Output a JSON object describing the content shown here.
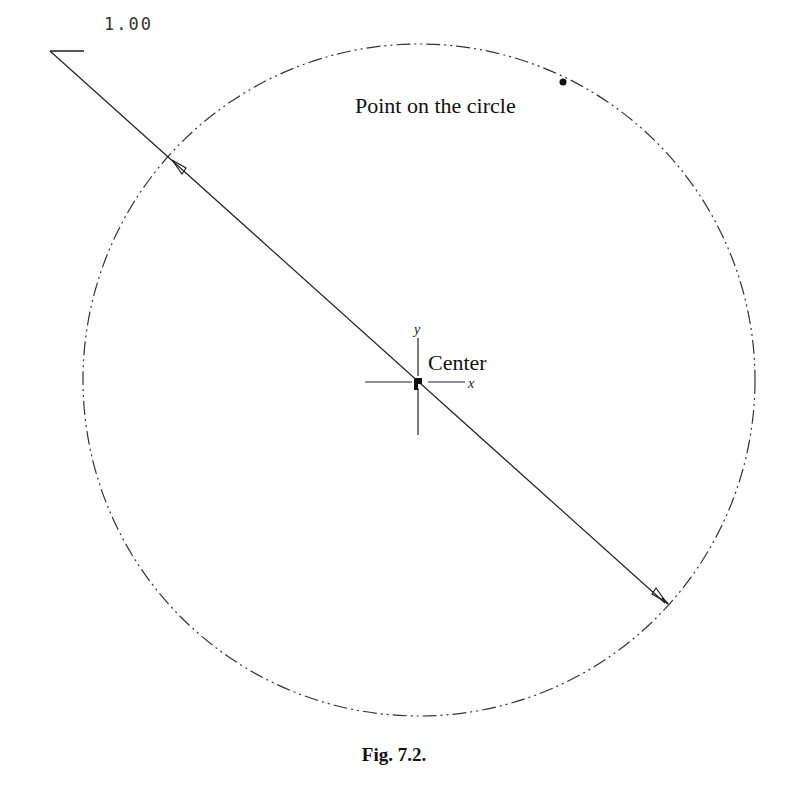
{
  "figure": {
    "caption": "Fig. 7.2.",
    "dimension_value": "1.00",
    "labels": {
      "point": "Point on the circle",
      "center": "Center",
      "axis_x": "x",
      "axis_y": "y"
    },
    "colors": {
      "line": "#222222",
      "background": "#ffffff"
    }
  }
}
